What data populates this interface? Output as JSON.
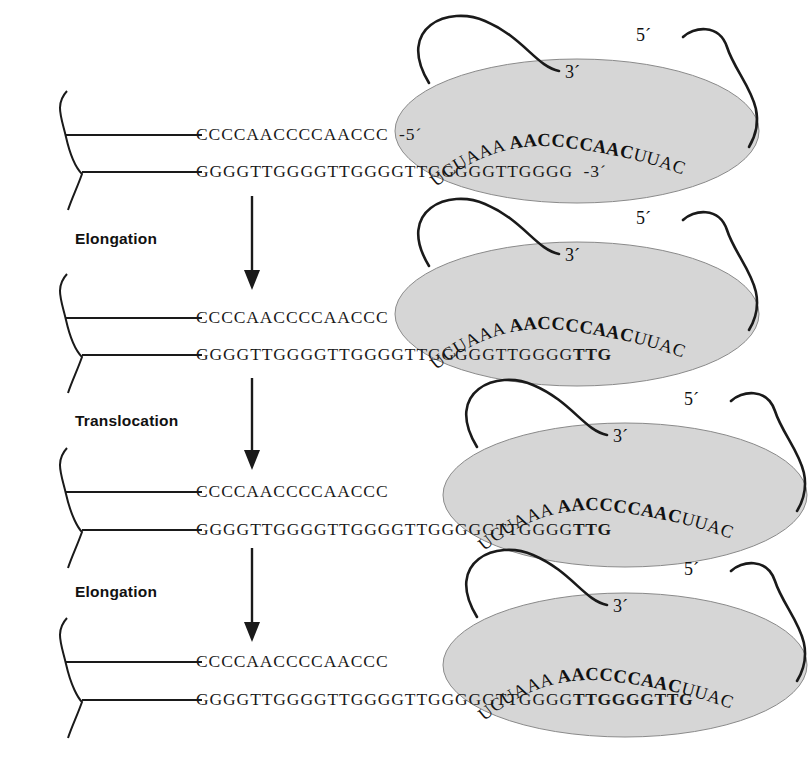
{
  "figure": {
    "ellipse_color": "#d6d6d6",
    "ellipse_stroke": "#8a8a8a",
    "line_color": "#1a1a1a"
  },
  "rna_template": {
    "left_plain": "UCUAAA",
    "bold": "AACCCCAAC",
    "right_plain": "UUAC",
    "three_prime_label": "3´",
    "five_prime_label": "5´"
  },
  "steps": [
    {
      "id": "step-elongation-1",
      "label": "Elongation"
    },
    {
      "id": "step-translocation",
      "label": "Translocation"
    },
    {
      "id": "step-elongation-2",
      "label": "Elongation"
    }
  ],
  "panels": [
    {
      "id": "panel-1",
      "top_strand": "CCCCAACCCCAACCC",
      "top_end_label": "-5´",
      "bottom_strand": "GGGGTTGGGGTTGGGGTTGGGGGTTGGGG",
      "bottom_bold": "",
      "bottom_end_label": "-3´"
    },
    {
      "id": "panel-2",
      "top_strand": "CCCCAACCCCAACCC",
      "top_end_label": "",
      "bottom_strand": "GGGGTTGGGGTTGGGGTTGGGGGTTGGGG",
      "bottom_bold": "TTG",
      "bottom_end_label": ""
    },
    {
      "id": "panel-3",
      "top_strand": "CCCCAACCCCAACCC",
      "top_end_label": "",
      "bottom_strand": "GGGGTTGGGGTTGGGGTTGGGGGTTGGGG",
      "bottom_bold": "TTG",
      "bottom_end_label": ""
    },
    {
      "id": "panel-4",
      "top_strand": "CCCCAACCCCAACCC",
      "top_end_label": "",
      "bottom_strand": "GGGGTTGGGGTTGGGGTTGGGGGTTGGGG",
      "bottom_bold": "TTGGGGTTG",
      "bottom_end_label": ""
    }
  ]
}
